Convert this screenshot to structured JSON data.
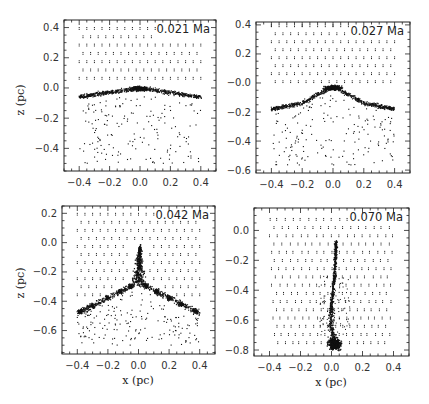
{
  "chart_data": [
    {
      "type": "scatter",
      "panel": "top-left",
      "title": "0.021 Ma",
      "xlabel": "",
      "ylabel": "z (pc)",
      "xlim": [
        -0.5,
        0.5
      ],
      "ylim": [
        -0.55,
        0.45
      ],
      "xticks": [
        -0.4,
        -0.2,
        0.0,
        0.2,
        0.4
      ],
      "xtick_labels": [
        "-0.4",
        "-0.2",
        "0.0",
        "0.2",
        "0.4"
      ],
      "yticks": [
        0.4,
        0.2,
        0.0,
        -0.2,
        -0.4
      ],
      "ytick_labels": [
        "0.4",
        "0.2",
        "0.0",
        "-0.2",
        "-0.4"
      ],
      "description": "Upper grid of particle pairs (z > 0); dense near-flat sheet at z ≈ 0 to -0.05 with central concentration at x ≈ 0; sparse scattered particles below (z down to -0.5).",
      "structure": {
        "grid_top": 0.4,
        "grid_bottom": 0.03,
        "sheet": [
          [
            -0.4,
            -0.06
          ],
          [
            -0.2,
            -0.03
          ],
          [
            0.0,
            0.0
          ],
          [
            0.2,
            -0.03
          ],
          [
            0.4,
            -0.06
          ]
        ],
        "core": [
          0.0,
          0.0
        ],
        "sparse_bottom": -0.5
      }
    },
    {
      "type": "scatter",
      "panel": "top-right",
      "title": "0.027 Ma",
      "xlabel": "",
      "ylabel": "",
      "xlim": [
        -0.5,
        0.5
      ],
      "ylim": [
        -0.62,
        0.42
      ],
      "xticks": [
        -0.4,
        -0.2,
        0.0,
        0.2,
        0.4
      ],
      "xtick_labels": [
        "-0.4",
        "-0.2",
        "0.0",
        "0.2",
        "0.4"
      ],
      "yticks": [
        0.4,
        0.2,
        0.0,
        -0.2,
        -0.4,
        -0.6
      ],
      "ytick_labels": [
        "0.4",
        "0.2",
        "-0.0",
        "-0.2",
        "-0.4",
        "-0.6"
      ],
      "description": "Sheet bent into a tent shape peaking at (0, -0.02), wings dropping to z ≈ -0.17 at x = ±0.4.",
      "structure": {
        "grid_top": 0.4,
        "grid_bottom": 0.0,
        "sheet": [
          [
            -0.4,
            -0.18
          ],
          [
            -0.2,
            -0.14
          ],
          [
            0.0,
            -0.02
          ],
          [
            0.2,
            -0.14
          ],
          [
            0.4,
            -0.18
          ]
        ],
        "core": [
          0.0,
          -0.03
        ],
        "sparse_bottom": -0.57
      }
    },
    {
      "type": "scatter",
      "panel": "bottom-left",
      "title": "0.042 Ma",
      "xlabel": "x (pc)",
      "ylabel": "z (pc)",
      "xlim": [
        -0.5,
        0.5
      ],
      "ylim": [
        -0.76,
        0.25
      ],
      "xticks": [
        -0.4,
        -0.2,
        0.0,
        0.2,
        0.4
      ],
      "xtick_labels": [
        "-0.4",
        "-0.2",
        "0.0",
        "0.2",
        "0.4"
      ],
      "yticks": [
        0.2,
        0.0,
        -0.2,
        -0.4,
        -0.6
      ],
      "ytick_labels": [
        "0.2",
        "0.0",
        "-0.2",
        "-0.4",
        "-0.6"
      ],
      "description": "Inverted-V sheet with clumpy fragments along the wings (peak z ≈ -0.27 at x = 0, wings to z ≈ -0.48 at x = ±0.4) plus a vertical spike rising from z ≈ -0.27 to z ≈ -0.02 at x ≈ 0.",
      "structure": {
        "grid_top": 0.2,
        "grid_bottom": -0.35,
        "sheet": [
          [
            -0.4,
            -0.48
          ],
          [
            -0.2,
            -0.38
          ],
          [
            0.0,
            -0.27
          ],
          [
            0.2,
            -0.38
          ],
          [
            0.4,
            -0.48
          ]
        ],
        "spike": [
          [
            0.0,
            -0.27
          ],
          [
            0.01,
            -0.02
          ]
        ],
        "sparse_bottom": -0.7
      }
    },
    {
      "type": "scatter",
      "panel": "bottom-right",
      "title": "0.070 Ma",
      "xlabel": "x (pc)",
      "ylabel": "",
      "xlim": [
        -0.5,
        0.5
      ],
      "ylim": [
        -0.84,
        0.15
      ],
      "xticks": [
        -0.4,
        -0.2,
        0.0,
        0.2,
        0.4
      ],
      "xtick_labels": [
        "-0.4",
        "-0.2",
        "0.0",
        "0.2",
        "0.4"
      ],
      "yticks": [
        0.0,
        -0.2,
        -0.4,
        -0.6,
        -0.8
      ],
      "ytick_labels": [
        "0.0",
        "-0.2",
        "-0.4",
        "-0.6",
        "-0.8"
      ],
      "description": "Particle grid fills the frame; a single thin dense filament runs vertically from z ≈ -0.07 near x = 0.02 down to a dense blob at z ≈ -0.72 to -0.82 around x = 0.0–0.05.",
      "structure": {
        "grid_top": 0.08,
        "grid_bottom": -0.8,
        "filament": [
          [
            0.03,
            -0.07
          ],
          [
            0.02,
            -0.3
          ],
          [
            0.0,
            -0.5
          ],
          [
            0.0,
            -0.65
          ],
          [
            0.02,
            -0.78
          ]
        ],
        "blob": [
          0.02,
          -0.76
        ]
      }
    }
  ],
  "figure": {
    "axis_labels": {
      "x": "x (pc)",
      "z": "z (pc)"
    },
    "ink_color": "#111111",
    "background": "#ffffff"
  }
}
